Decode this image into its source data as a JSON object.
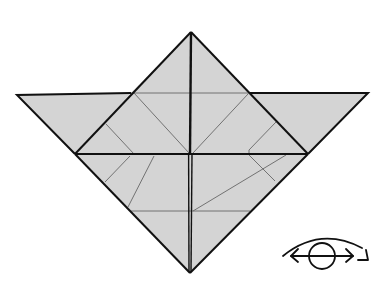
{
  "diagram": {
    "type": "origami-fold-step",
    "colors": {
      "background": "#ffffff",
      "paper_fill": "#d4d4d4",
      "bold_line": "#111111",
      "crease_line": "#555555",
      "symbol": "#111111"
    },
    "shapes": {
      "wings": {
        "points": "17,95 131,93 75,154"
      },
      "wings_right": {
        "points": "250,93 368,93 308,154"
      },
      "upper_square": {
        "points": "191,32 250,93 308,154 75,154 131,93"
      },
      "lower_triangle": {
        "points": "75,154 308,154 190,273"
      }
    },
    "symbols": [
      {
        "name": "turn-over-symbol",
        "meaning": "turn model over"
      }
    ]
  }
}
